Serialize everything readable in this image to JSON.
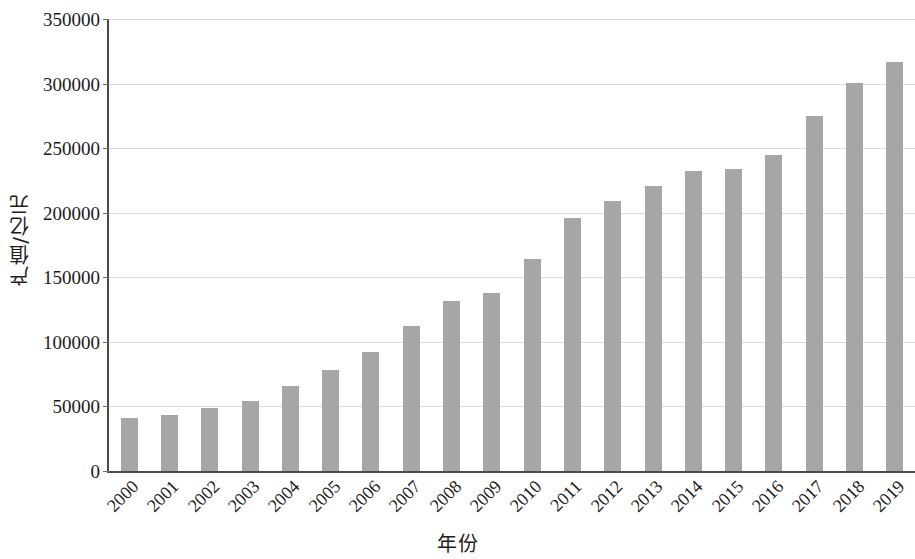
{
  "chart_data": {
    "type": "bar",
    "title": "",
    "xlabel": "年份",
    "ylabel": "产值/亿元",
    "categories": [
      "2000",
      "2001",
      "2002",
      "2003",
      "2004",
      "2005",
      "2006",
      "2007",
      "2008",
      "2009",
      "2010",
      "2011",
      "2012",
      "2013",
      "2014",
      "2015",
      "2016",
      "2017",
      "2018",
      "2019"
    ],
    "values": [
      41000,
      43000,
      49000,
      54500,
      65500,
      78000,
      92500,
      112000,
      132000,
      138000,
      164000,
      196000,
      209000,
      221000,
      232000,
      234000,
      245000,
      275000,
      300500,
      317000
    ],
    "ylim": [
      0,
      350000
    ],
    "ytick_labels": [
      "0",
      "50000",
      "100000",
      "150000",
      "200000",
      "250000",
      "300000",
      "350000"
    ],
    "ytick_values": [
      0,
      50000,
      100000,
      150000,
      200000,
      250000,
      300000,
      350000
    ],
    "grid": true,
    "legend": "none",
    "bar_color": "#a6a6a6",
    "gridline_color": "#d9d9d9",
    "axis_color": "#4a4a4a"
  }
}
